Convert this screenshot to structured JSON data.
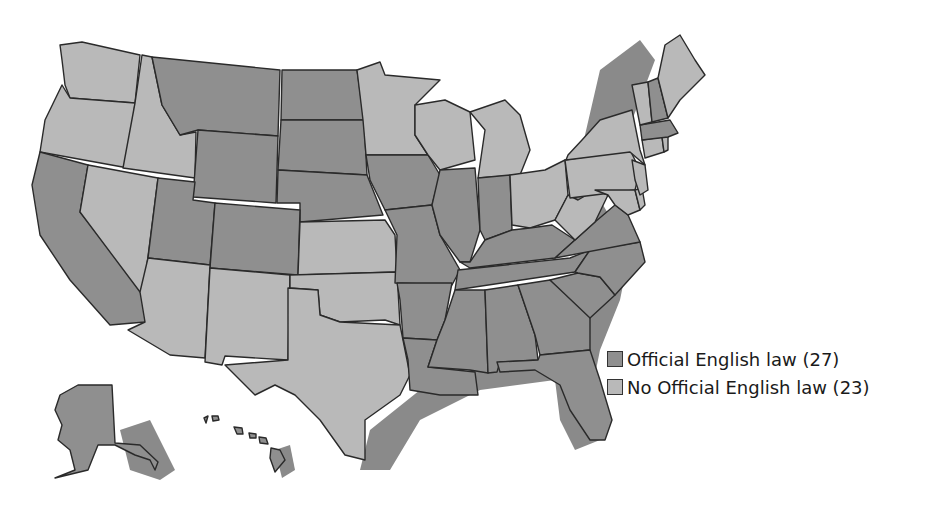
{
  "map": {
    "title": "",
    "subject": "States with Official English laws",
    "colors": {
      "official": "#8f8f8f",
      "no_official": "#b9b9b9",
      "shadow": "#8a8a8a",
      "border": "#2a2a2a"
    }
  },
  "legend": {
    "items": [
      {
        "label": "Official English law (27)",
        "color": "#8f8f8f"
      },
      {
        "label": "No Official English law (23)",
        "color": "#b9b9b9"
      }
    ]
  },
  "states": {
    "official": [
      "Montana",
      "North Dakota",
      "South Dakota",
      "Wyoming",
      "Nebraska",
      "Utah",
      "Colorado",
      "California",
      "Iowa",
      "Missouri",
      "Arkansas",
      "Louisiana",
      "Illinois",
      "Indiana",
      "Kentucky",
      "Tennessee",
      "Mississippi",
      "Alabama",
      "Georgia",
      "Florida",
      "South Carolina",
      "North Carolina",
      "Virginia",
      "New Hampshire",
      "Massachusetts",
      "Alaska",
      "Hawaii"
    ],
    "no_official": [
      "Washington",
      "Oregon",
      "Idaho",
      "Nevada",
      "Arizona",
      "New Mexico",
      "Texas",
      "Oklahoma",
      "Kansas",
      "Minnesota",
      "Wisconsin",
      "Michigan",
      "Ohio",
      "West Virginia",
      "Pennsylvania",
      "New York",
      "New Jersey",
      "Maryland",
      "Delaware",
      "Connecticut",
      "Rhode Island",
      "Vermont",
      "Maine"
    ]
  }
}
